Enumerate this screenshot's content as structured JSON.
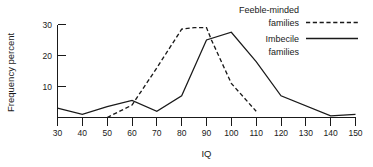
{
  "chart_data": {
    "type": "line",
    "title": "",
    "xlabel": "IQ",
    "ylabel": "Frequency percent",
    "xlim": [
      30,
      150
    ],
    "ylim": [
      0,
      31
    ],
    "xticks": [
      30,
      40,
      50,
      60,
      70,
      80,
      90,
      100,
      110,
      120,
      130,
      140,
      150
    ],
    "xtick_labels": [
      "30",
      "40",
      "50",
      "60",
      "70",
      "80",
      "90",
      "100",
      "110",
      "120",
      "130",
      "140",
      "150"
    ],
    "yticks": [
      10,
      20,
      30
    ],
    "ytick_labels": [
      "10",
      "20",
      "30"
    ],
    "grid": false,
    "legend_position": "top-right",
    "series": [
      {
        "name": "Feeble-minded families",
        "style": "dashed",
        "color": "#1a1a1a",
        "x": [
          50,
          60,
          70,
          80,
          85,
          90,
          92,
          100,
          110
        ],
        "values": [
          0,
          4,
          16,
          28.5,
          29,
          29,
          25,
          11,
          2
        ]
      },
      {
        "name": "Imbecile families",
        "style": "solid",
        "color": "#1a1a1a",
        "x": [
          30,
          40,
          50,
          60,
          70,
          80,
          90,
          100,
          110,
          120,
          140,
          150
        ],
        "values": [
          3,
          1,
          3.5,
          5.5,
          2,
          7,
          25,
          27.5,
          18,
          7,
          0.5,
          1
        ]
      }
    ]
  },
  "legend": {
    "entries": [
      {
        "line1": "Feeble-minded",
        "line2": "families",
        "style": "dashed"
      },
      {
        "line1": "Imbecile",
        "line2": "families",
        "style": "solid"
      }
    ]
  },
  "axes": {
    "x_title": "IQ",
    "y_title": "Frequency percent"
  }
}
